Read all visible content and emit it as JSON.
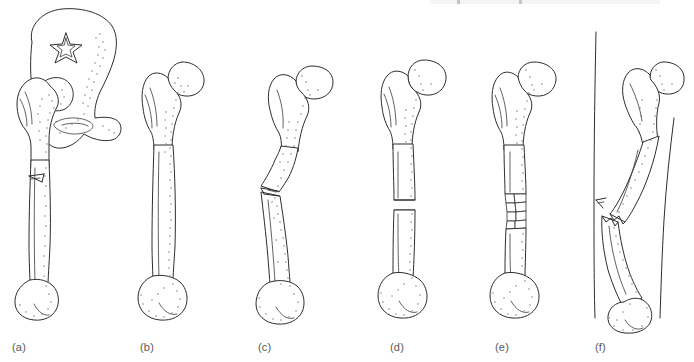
{
  "figure": {
    "width": 694,
    "height": 362,
    "background_color": "#ffffff",
    "ink_color": "#2d2d2d",
    "caption_color": "#58585a",
    "style": "hand-drawn black-and-white line art with stippled shading",
    "scan_artifact_present": true
  },
  "panels": [
    {
      "id": "a",
      "caption": "(a)",
      "caption_x": 12,
      "caption_y": 341,
      "x": 4,
      "width": 132,
      "subject": "hemipelvis with proximal femur",
      "fracture": "stellate fracture of iliac wing and linear fissure fracture of femoral shaft",
      "has_pelvis": true,
      "has_stellate": true,
      "has_fissure": true,
      "skin_outline": false
    },
    {
      "id": "b",
      "caption": "(b)",
      "caption_x": 140,
      "caption_y": 341,
      "x": 128,
      "width": 110,
      "subject": "whole femur, anterior view",
      "fracture": "intact bone, no fracture",
      "has_pelvis": false,
      "has_stellate": false,
      "has_fissure": false,
      "skin_outline": false
    },
    {
      "id": "c",
      "caption": "(c)",
      "caption_x": 258,
      "caption_y": 341,
      "x": 248,
      "width": 112,
      "subject": "bowed femur",
      "fracture": "incomplete greenstick fracture with angulation",
      "has_pelvis": false,
      "has_stellate": false,
      "has_fissure": true,
      "skin_outline": false
    },
    {
      "id": "d",
      "caption": "(d)",
      "caption_x": 390,
      "caption_y": 341,
      "x": 368,
      "width": 110,
      "subject": "femur with mid-shaft break",
      "fracture": "complete transverse fracture",
      "has_pelvis": false,
      "has_stellate": false,
      "has_fissure": false,
      "skin_outline": false
    },
    {
      "id": "e",
      "caption": "(e)",
      "caption_x": 495,
      "caption_y": 341,
      "x": 482,
      "width": 110,
      "subject": "femur with fragmented shaft",
      "fracture": "comminuted fracture with multiple bone fragments",
      "has_pelvis": false,
      "has_stellate": false,
      "has_fissure": false,
      "skin_outline": false
    },
    {
      "id": "f",
      "caption": "(f)",
      "caption_x": 595,
      "caption_y": 341,
      "x": 580,
      "width": 112,
      "subject": "displaced femur piercing the limb contour",
      "fracture": "open (compound) fracture with bone ends protruding through skin",
      "has_pelvis": false,
      "has_stellate": false,
      "has_fissure": false,
      "skin_outline": true
    }
  ]
}
